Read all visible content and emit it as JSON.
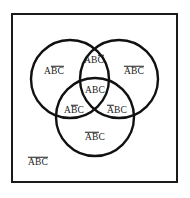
{
  "figure": {
    "type": "venn-diagram-3-set",
    "sets": [
      "A",
      "B",
      "C"
    ],
    "background_color": "#ffffff",
    "stroke_color": "#111111",
    "frame_color": "#1a1a1a"
  },
  "frame": {
    "name": "universal-set-rectangle"
  },
  "circles": [
    {
      "name": "circle-A",
      "label": "A",
      "cx": 70,
      "cy": 79,
      "r": 39
    },
    {
      "name": "circle-B",
      "label": "B",
      "cx": 119,
      "cy": 79,
      "r": 39
    },
    {
      "name": "circle-C",
      "label": "C",
      "cx": 95,
      "cy": 117,
      "r": 39
    }
  ],
  "regions": {
    "a_only": {
      "plain": "A",
      "barred_tail": "BC",
      "full": "ABC",
      "x": 54,
      "y": 71
    },
    "ab_not_c": {
      "plain": "AB",
      "barred_tail": "C",
      "full": "ABC",
      "x": 94,
      "y": 60
    },
    "b_only": {
      "plain": "",
      "barred_head": "A",
      "plain_mid": "B",
      "barred_tail": "C",
      "full": "ABC",
      "x": 134,
      "y": 71
    },
    "abc": {
      "plain": "ABC",
      "full": "ABC",
      "x": 95,
      "y": 91
    },
    "ac_not_b": {
      "plain": "A",
      "barred_mid": "B",
      "plain_tail": "C",
      "full": "ABC",
      "x": 74,
      "y": 110
    },
    "bc_not_a": {
      "barred_head": "A",
      "plain_tail": "BC",
      "full": "ABC",
      "x": 117,
      "y": 110
    },
    "c_only": {
      "barred_head": "AB",
      "plain_tail": "C",
      "full": "ABC",
      "x": 95,
      "y": 137
    },
    "outside": {
      "barred_all": "ABC",
      "full": "ABC",
      "x": 38,
      "y": 162
    }
  },
  "labels": {
    "a_only_text": "ABC",
    "ab_not_c_text": "ABC",
    "b_only_text": "ABC",
    "abc_text": "ABC",
    "ac_not_b_text": "ABC",
    "bc_not_a_text": "ABC",
    "c_only_text": "ABC",
    "outside_text": "ABC"
  },
  "chart_data": {
    "type": "diagram",
    "title": "",
    "minterms": [
      {
        "region": "A only",
        "notation": "A B̅ C̅",
        "A": true,
        "B": false,
        "C": false
      },
      {
        "region": "A and B, not C",
        "notation": "A B C̅",
        "A": true,
        "B": true,
        "C": false
      },
      {
        "region": "B only",
        "notation": "A̅ B C̅",
        "A": false,
        "B": true,
        "C": false
      },
      {
        "region": "A and B and C",
        "notation": "A B C",
        "A": true,
        "B": true,
        "C": true
      },
      {
        "region": "A and C, not B",
        "notation": "A B̅ C",
        "A": true,
        "B": false,
        "C": true
      },
      {
        "region": "B and C, not A",
        "notation": "A̅ B C",
        "A": false,
        "B": true,
        "C": true
      },
      {
        "region": "C only",
        "notation": "A̅ B̅ C",
        "A": false,
        "B": false,
        "C": true
      },
      {
        "region": "outside all circles",
        "notation": "A̅ B̅ C̅",
        "A": false,
        "B": false,
        "C": false
      }
    ]
  }
}
